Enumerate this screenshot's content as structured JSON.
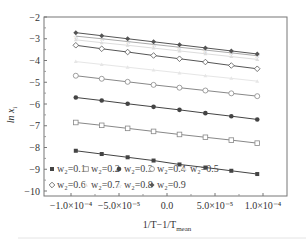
{
  "chart_data": {
    "type": "line",
    "title": "",
    "xlabel": "1/T−1/T_mean",
    "ylabel": "ln x_i",
    "xlim": [
      -0.000125,
      0.000125
    ],
    "ylim": [
      -10.1,
      -2
    ],
    "grid": false,
    "legend_position": "lower left (inside)",
    "x_ticks": [
      -0.0001,
      -5e-05,
      0.0,
      5e-05,
      0.0001
    ],
    "x_tick_labels": [
      "−1.0×10⁻⁴",
      "−5.0×10⁻⁵",
      "0.0",
      "5.0×10⁻⁵",
      "1.0×10⁻⁴"
    ],
    "y_ticks": [
      -2,
      -3,
      -4,
      -5,
      -6,
      -7,
      -8,
      -9,
      -10
    ],
    "y_tick_labels": [
      "−2",
      "−3",
      "−4",
      "−5",
      "−6",
      "−7",
      "−8",
      "−9",
      "−10"
    ],
    "x": [
      -9.5e-05,
      -6.8e-05,
      -4.1e-05,
      -1.4e-05,
      1.3e-05,
      4e-05,
      6.7e-05,
      9.4e-05
    ],
    "series": [
      {
        "name": "w2=0.1",
        "marker": "filled-square",
        "color": "#444444",
        "values": [
          -8.15,
          -8.3,
          -8.45,
          -8.6,
          -8.78,
          -8.92,
          -9.07,
          -9.22
        ]
      },
      {
        "name": "w2=0.2",
        "marker": "open-square",
        "color": "#888888",
        "values": [
          -6.85,
          -6.98,
          -7.12,
          -7.26,
          -7.4,
          -7.53,
          -7.66,
          -7.8
        ]
      },
      {
        "name": "w2=0.3",
        "marker": "filled-circle",
        "color": "#444444",
        "values": [
          -5.7,
          -5.84,
          -5.99,
          -6.13,
          -6.27,
          -6.42,
          -6.56,
          -6.71
        ]
      },
      {
        "name": "w2=0.4",
        "marker": "open-circle",
        "color": "#888888",
        "values": [
          -4.7,
          -4.84,
          -4.98,
          -5.12,
          -5.25,
          -5.38,
          -5.51,
          -5.64
        ]
      },
      {
        "name": "w2=0.5",
        "marker": "filled-triangle",
        "color": "#e6e6e6",
        "values": [
          -4.05,
          -4.18,
          -4.31,
          -4.44,
          -4.57,
          -4.7,
          -4.82,
          -4.95
        ]
      },
      {
        "name": "w2=0.6",
        "marker": "open-diamond",
        "color": "#555555",
        "values": [
          -3.3,
          -3.46,
          -3.61,
          -3.77,
          -3.92,
          -4.07,
          -4.23,
          -4.38
        ]
      },
      {
        "name": "w2=0.7",
        "marker": "filled-triangle-small",
        "color": "#dddddd",
        "values": [
          -3.05,
          -3.18,
          -3.3,
          -3.43,
          -3.56,
          -3.69,
          -3.82,
          -3.95
        ]
      },
      {
        "name": "w2=0.8",
        "marker": "open-star",
        "color": "#aaaaaa",
        "values": [
          -2.88,
          -3.0,
          -3.13,
          -3.26,
          -3.39,
          -3.52,
          -3.65,
          -3.78
        ]
      },
      {
        "name": "w2=0.9",
        "marker": "filled-diamond",
        "color": "#555555",
        "values": [
          -2.72,
          -2.86,
          -3.0,
          -3.14,
          -3.28,
          -3.42,
          -3.56,
          -3.7
        ]
      }
    ],
    "legend": [
      [
        "w₂=0.1",
        "w₂=0.2",
        "w₂=0.3",
        "w₂=0.4",
        "w₂=0.5"
      ],
      [
        "w₂=0.6",
        "w₂=0.7",
        "w₂=0.8",
        "w₂=0.9"
      ]
    ]
  },
  "labels": {
    "ylabel": "ln x",
    "ylabel_sub": "i",
    "xlabel_main": "1/T−1/T",
    "xlabel_sub": "mean"
  }
}
